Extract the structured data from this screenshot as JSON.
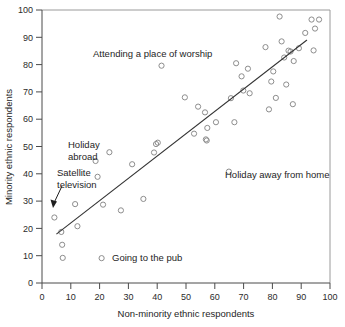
{
  "chart_data": {
    "type": "scatter",
    "title": "",
    "xlabel": "Non-minority ethnic respondents",
    "ylabel": "Minority ethnic respondents",
    "xlim": [
      0,
      100
    ],
    "ylim": [
      0,
      100
    ],
    "xticks": [
      0,
      10,
      20,
      30,
      40,
      50,
      60,
      70,
      80,
      90,
      100
    ],
    "yticks": [
      0,
      10,
      20,
      30,
      40,
      50,
      60,
      70,
      80,
      90,
      100
    ],
    "grid": false,
    "legend": "none",
    "marker": "open-circle",
    "marker_color": "#8d8d8d",
    "points": [
      [
        4.3,
        24.0
      ],
      [
        6.7,
        18.7
      ],
      [
        7.0,
        14.0
      ],
      [
        7.2,
        9.2
      ],
      [
        11.5,
        28.9
      ],
      [
        12.3,
        20.8
      ],
      [
        18.6,
        44.7
      ],
      [
        19.3,
        38.9
      ],
      [
        20.7,
        9.1
      ],
      [
        21.2,
        28.7
      ],
      [
        23.4,
        47.9
      ],
      [
        27.4,
        26.6
      ],
      [
        31.3,
        43.5
      ],
      [
        35.2,
        30.8
      ],
      [
        38.9,
        47.8
      ],
      [
        39.6,
        50.9
      ],
      [
        40.2,
        51.4
      ],
      [
        41.5,
        79.6
      ],
      [
        49.6,
        68.0
      ],
      [
        52.8,
        54.7
      ],
      [
        54.2,
        64.6
      ],
      [
        56.6,
        62.5
      ],
      [
        56.9,
        52.6
      ],
      [
        57.2,
        52.2
      ],
      [
        57.4,
        56.8
      ],
      [
        60.4,
        58.9
      ],
      [
        64.9,
        40.8
      ],
      [
        65.6,
        67.7
      ],
      [
        66.8,
        58.9
      ],
      [
        67.4,
        80.5
      ],
      [
        69.3,
        75.7
      ],
      [
        69.9,
        70.5
      ],
      [
        71.5,
        78.5
      ],
      [
        72.1,
        69.5
      ],
      [
        77.6,
        86.4
      ],
      [
        78.8,
        63.6
      ],
      [
        79.6,
        73.8
      ],
      [
        80.3,
        77.5
      ],
      [
        81.2,
        67.8
      ],
      [
        82.5,
        97.6
      ],
      [
        83.2,
        88.5
      ],
      [
        84.1,
        82.6
      ],
      [
        84.8,
        72.7
      ],
      [
        85.6,
        85.1
      ],
      [
        86.3,
        84.8
      ],
      [
        87.1,
        65.5
      ],
      [
        87.4,
        81.3
      ],
      [
        89.2,
        86.0
      ],
      [
        91.4,
        91.6
      ],
      [
        93.6,
        96.5
      ],
      [
        94.3,
        85.2
      ],
      [
        94.8,
        93.2
      ],
      [
        96.2,
        96.5
      ]
    ],
    "fit_line": {
      "x0": 5.0,
      "y0": 17.9,
      "x1": 92.0,
      "y1": 89.0
    },
    "annotations": [
      {
        "id": "attending-worship",
        "text": "Attending a place of worship",
        "lines": [
          "Attending a place of worship"
        ],
        "x": 41.5,
        "y": 79.6,
        "anchor": "above"
      },
      {
        "id": "holiday-abroad",
        "text": "Holiday abroad",
        "lines": [
          "Holiday",
          "abroad"
        ],
        "x": 23.4,
        "y": 47.9,
        "anchor": "left"
      },
      {
        "id": "satellite-television",
        "text": "Satellite television",
        "lines": [
          "Satellite",
          "television"
        ],
        "x": 4.3,
        "y": 24.0,
        "anchor": "arrow"
      },
      {
        "id": "holiday-away-from-home",
        "text": "Holiday away from home",
        "lines": [
          "Holiday away from home"
        ],
        "x": 64.9,
        "y": 40.8,
        "anchor": "right"
      },
      {
        "id": "going-to-the-pub",
        "text": "Going to the pub",
        "lines": [
          "Going to the pub"
        ],
        "x": 20.7,
        "y": 9.1,
        "anchor": "right"
      }
    ]
  },
  "labels": {
    "x_axis_title": "Non-minority ethnic respondents",
    "y_axis_title": "Minority ethnic respondents",
    "annot_worship": "Attending a place of worship",
    "annot_holiday_abroad_1": "Holiday",
    "annot_holiday_abroad_2": "abroad",
    "annot_satellite_1": "Satellite",
    "annot_satellite_2": "television",
    "annot_holiday_away": "Holiday away from home",
    "annot_pub": "Going to the pub"
  },
  "ticks": {
    "x": [
      "0",
      "10",
      "20",
      "30",
      "40",
      "50",
      "60",
      "70",
      "80",
      "90",
      "100"
    ],
    "y": [
      "0",
      "10",
      "20",
      "30",
      "40",
      "50",
      "60",
      "70",
      "80",
      "90",
      "100"
    ]
  },
  "colors": {
    "marker": "#8d8d8d",
    "line": "#333333",
    "axis": "#4a4a4a",
    "text": "#1e1e1e",
    "background": "#ffffff"
  }
}
